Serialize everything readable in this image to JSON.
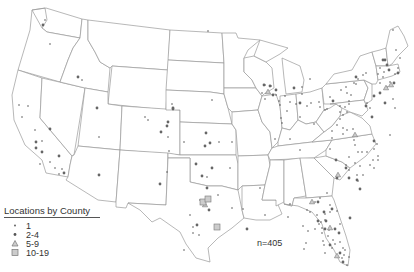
{
  "map": {
    "title": "",
    "region": "Contiguous United States",
    "colors": {
      "state_border": "#9a9a9a",
      "marker_fill": "#555555",
      "marker_light": "#999999"
    }
  },
  "legend": {
    "title": "Locations by County",
    "items": [
      {
        "label": "1",
        "symbol": "small-dot"
      },
      {
        "label": "2-4",
        "symbol": "star-dot"
      },
      {
        "label": "5-9",
        "symbol": "triangle"
      },
      {
        "label": "10-19",
        "symbol": "square"
      }
    ]
  },
  "annotation": {
    "total": "n=405"
  },
  "markers": {
    "small": [
      [
        45,
        20
      ],
      [
        50,
        44
      ],
      [
        82,
        80
      ],
      [
        19,
        105
      ],
      [
        28,
        106
      ],
      [
        22,
        117
      ],
      [
        35,
        130
      ],
      [
        42,
        141
      ],
      [
        99,
        137
      ],
      [
        50,
        162
      ],
      [
        62,
        169
      ],
      [
        59,
        174
      ],
      [
        55,
        168
      ],
      [
        40,
        164
      ],
      [
        172,
        104
      ],
      [
        145,
        117
      ],
      [
        148,
        120
      ],
      [
        168,
        137
      ],
      [
        184,
        142
      ],
      [
        169,
        151
      ],
      [
        167,
        172
      ],
      [
        208,
        31
      ],
      [
        212,
        100
      ],
      [
        232,
        142
      ],
      [
        219,
        142
      ],
      [
        230,
        168
      ],
      [
        207,
        177
      ],
      [
        200,
        200
      ],
      [
        218,
        195
      ],
      [
        190,
        215
      ],
      [
        193,
        227
      ],
      [
        193,
        233
      ],
      [
        199,
        235
      ],
      [
        184,
        250
      ],
      [
        232,
        208
      ],
      [
        243,
        209
      ],
      [
        265,
        215
      ],
      [
        288,
        217
      ],
      [
        290,
        204
      ],
      [
        260,
        188
      ],
      [
        290,
        139
      ],
      [
        275,
        139
      ],
      [
        281,
        118
      ],
      [
        300,
        117
      ],
      [
        300,
        150
      ],
      [
        314,
        124
      ],
      [
        330,
        149
      ],
      [
        332,
        138
      ],
      [
        346,
        165
      ],
      [
        349,
        157
      ],
      [
        363,
        175
      ],
      [
        378,
        156
      ],
      [
        390,
        135
      ],
      [
        395,
        108
      ],
      [
        393,
        99
      ],
      [
        367,
        103
      ],
      [
        370,
        108
      ],
      [
        354,
        83
      ],
      [
        349,
        104
      ],
      [
        345,
        107
      ],
      [
        340,
        106
      ],
      [
        340,
        112
      ],
      [
        343,
        115
      ],
      [
        347,
        112
      ],
      [
        327,
        109
      ],
      [
        311,
        103
      ],
      [
        302,
        94
      ],
      [
        287,
        111
      ],
      [
        280,
        105
      ],
      [
        279,
        101
      ],
      [
        265,
        99
      ],
      [
        262,
        93
      ],
      [
        265,
        85
      ],
      [
        271,
        86
      ],
      [
        276,
        95
      ],
      [
        285,
        96
      ],
      [
        296,
        104
      ],
      [
        307,
        106
      ],
      [
        330,
        97
      ],
      [
        282,
        123
      ],
      [
        290,
        102
      ],
      [
        302,
        87
      ],
      [
        310,
        79
      ],
      [
        319,
        102
      ],
      [
        320,
        107
      ],
      [
        325,
        110
      ],
      [
        341,
        90
      ],
      [
        346,
        87
      ],
      [
        347,
        93
      ],
      [
        351,
        95
      ],
      [
        356,
        84
      ],
      [
        358,
        79
      ],
      [
        363,
        75
      ],
      [
        366,
        73
      ],
      [
        380,
        68
      ],
      [
        384,
        72
      ],
      [
        378,
        74
      ],
      [
        383,
        77
      ],
      [
        380,
        83
      ],
      [
        387,
        87
      ],
      [
        390,
        82
      ],
      [
        395,
        74
      ],
      [
        398,
        68
      ],
      [
        400,
        58
      ],
      [
        396,
        50
      ],
      [
        393,
        30
      ],
      [
        349,
        101
      ],
      [
        340,
        119
      ],
      [
        337,
        125
      ],
      [
        343,
        128
      ],
      [
        332,
        131
      ],
      [
        343,
        134
      ],
      [
        347,
        130
      ],
      [
        353,
        129
      ],
      [
        354,
        140
      ],
      [
        358,
        152
      ],
      [
        355,
        145
      ],
      [
        362,
        152
      ],
      [
        367,
        152
      ],
      [
        374,
        149
      ],
      [
        377,
        144
      ],
      [
        378,
        160
      ],
      [
        373,
        160
      ],
      [
        370,
        165
      ],
      [
        374,
        168
      ],
      [
        360,
        166
      ],
      [
        355,
        163
      ],
      [
        349,
        170
      ],
      [
        357,
        175
      ],
      [
        358,
        181
      ],
      [
        327,
        193
      ],
      [
        320,
        198
      ],
      [
        315,
        202
      ],
      [
        330,
        205
      ],
      [
        337,
        211
      ],
      [
        303,
        226
      ],
      [
        308,
        231
      ],
      [
        306,
        243
      ],
      [
        304,
        249
      ],
      [
        322,
        228
      ],
      [
        322,
        233
      ],
      [
        329,
        230
      ],
      [
        328,
        236
      ],
      [
        332,
        248
      ],
      [
        325,
        253
      ],
      [
        335,
        244
      ],
      [
        342,
        258
      ],
      [
        347,
        265
      ],
      [
        344,
        255
      ],
      [
        345,
        250
      ],
      [
        340,
        224
      ],
      [
        330,
        212
      ],
      [
        325,
        214
      ],
      [
        310,
        212
      ],
      [
        307,
        210
      ],
      [
        315,
        229
      ],
      [
        323,
        241
      ],
      [
        340,
        242
      ],
      [
        343,
        248
      ],
      [
        349,
        257
      ],
      [
        325,
        220
      ],
      [
        321,
        222
      ],
      [
        317,
        215
      ],
      [
        319,
        224
      ],
      [
        324,
        245
      ],
      [
        333,
        240
      ]
    ],
    "medium": [
      [
        43,
        25
      ],
      [
        78,
        77
      ],
      [
        97,
        108
      ],
      [
        50,
        129
      ],
      [
        59,
        156
      ],
      [
        64,
        173
      ],
      [
        36,
        142
      ],
      [
        36,
        148
      ],
      [
        42,
        152
      ],
      [
        99,
        175
      ],
      [
        173,
        108
      ],
      [
        173,
        109
      ],
      [
        168,
        122
      ],
      [
        167,
        126
      ],
      [
        161,
        132
      ],
      [
        205,
        146
      ],
      [
        206,
        133
      ],
      [
        210,
        143
      ],
      [
        196,
        164
      ],
      [
        212,
        168
      ],
      [
        202,
        176
      ],
      [
        207,
        188
      ],
      [
        160,
        184
      ],
      [
        197,
        225
      ],
      [
        209,
        210
      ],
      [
        247,
        229
      ],
      [
        264,
        85
      ],
      [
        270,
        86
      ],
      [
        273,
        95
      ],
      [
        276,
        90
      ],
      [
        294,
        88
      ],
      [
        300,
        103
      ],
      [
        333,
        101
      ],
      [
        366,
        106
      ],
      [
        372,
        117
      ],
      [
        374,
        141
      ],
      [
        336,
        160
      ],
      [
        346,
        168
      ],
      [
        337,
        178
      ],
      [
        349,
        178
      ],
      [
        357,
        180
      ],
      [
        360,
        189
      ],
      [
        318,
        202
      ],
      [
        332,
        209
      ],
      [
        350,
        218
      ],
      [
        385,
        103
      ],
      [
        394,
        83
      ],
      [
        398,
        73
      ],
      [
        356,
        77
      ],
      [
        374,
        96
      ],
      [
        385,
        60
      ],
      [
        387,
        65
      ],
      [
        380,
        93
      ],
      [
        318,
        221
      ],
      [
        326,
        221
      ],
      [
        324,
        212
      ],
      [
        339,
        233
      ],
      [
        335,
        229
      ],
      [
        325,
        229
      ],
      [
        330,
        245
      ],
      [
        343,
        262
      ],
      [
        340,
        253
      ],
      [
        389,
        70
      ],
      [
        383,
        60
      ]
    ],
    "triangles": [
      [
        268,
        92
      ],
      [
        312,
        202
      ],
      [
        330,
        228
      ],
      [
        337,
        256
      ],
      [
        205,
        205
      ],
      [
        338,
        175
      ],
      [
        355,
        135
      ],
      [
        386,
        88
      ],
      [
        391,
        85
      ]
    ],
    "squares": [
      [
        203,
        202
      ],
      [
        208,
        199
      ],
      [
        217,
        227
      ]
    ]
  }
}
